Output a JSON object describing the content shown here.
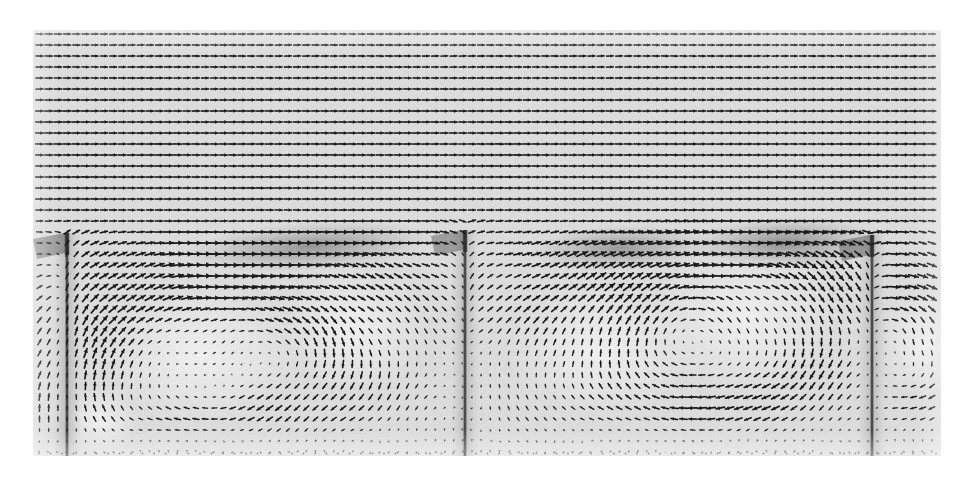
{
  "figure": {
    "kind": "vector-field-plot",
    "title": "Velocity vector field of turbulent flow over a ribbed channel wall",
    "width": 970,
    "height": 477,
    "background_color": "#ffffff",
    "field_background_color": "#dcdcdc",
    "arrow_color": "#1a1a1a",
    "shadow_color": "#6e6e6e"
  },
  "plot_area": {
    "left": 33,
    "top": 30,
    "right": 941,
    "bottom": 456,
    "width": 908,
    "height": 426
  },
  "chart_data": {
    "type": "scatter",
    "subtype": "quiver-vector-field",
    "title": "Velocity vector field of turbulent flow over a ribbed channel wall",
    "xlabel": "",
    "ylabel": "",
    "grid": false,
    "legend": null,
    "xlim": [
      0,
      908
    ],
    "ylim": [
      0,
      426
    ],
    "grid_spacing": {
      "dx": 9.2,
      "dy": 11.0
    },
    "arrow_scale": 7.6,
    "arrow_head_frac": 0.42,
    "freestream": {
      "description": "Uniform left-to-right high-speed core flow above the cavity line",
      "y_range": [
        0,
        210
      ],
      "u": 1.0,
      "v": 0.0,
      "direction_deg": 0
    },
    "cavity_line_y": 220,
    "ribs": [
      {
        "name": "rib-left",
        "x": 67,
        "top_y": 233,
        "bottom_y": 456,
        "thickness": 5
      },
      {
        "name": "rib-middle",
        "x": 465,
        "top_y": 230,
        "bottom_y": 456,
        "thickness": 5
      },
      {
        "name": "rib-right",
        "x": 872,
        "top_y": 235,
        "bottom_y": 456,
        "thickness": 5
      }
    ],
    "vortices": [
      {
        "name": "cavity-1-primary",
        "cx": 200,
        "cy": 355,
        "rx": 120,
        "ry": 82,
        "strength": 1.25,
        "sense": "counterclockwise"
      },
      {
        "name": "cavity-1-secondary",
        "cx": 355,
        "cy": 330,
        "rx": 85,
        "ry": 75,
        "strength": 0.62,
        "sense": "counterclockwise"
      },
      {
        "name": "cavity-1-corner",
        "cx": 100,
        "cy": 420,
        "rx": 45,
        "ry": 40,
        "strength": 0.35,
        "sense": "counterclockwise"
      },
      {
        "name": "cavity-2-primary",
        "cx": 745,
        "cy": 320,
        "rx": 110,
        "ry": 86,
        "strength": 1.3,
        "sense": "counterclockwise"
      },
      {
        "name": "cavity-2-upstream",
        "cx": 600,
        "cy": 350,
        "rx": 110,
        "ry": 78,
        "strength": 0.7,
        "sense": "counterclockwise"
      },
      {
        "name": "cavity-3-corner",
        "cx": 920,
        "cy": 345,
        "rx": 48,
        "ry": 62,
        "strength": 0.95,
        "sense": "counterclockwise"
      }
    ],
    "shear_layers": [
      {
        "name": "shear-band-1",
        "x0": 200,
        "x1": 420,
        "y0": 255,
        "y1": 238,
        "intensity": 0.95,
        "thickness": 16
      },
      {
        "name": "shear-band-2",
        "x0": 540,
        "x1": 700,
        "y0": 252,
        "y1": 244,
        "intensity": 0.88,
        "thickness": 15
      },
      {
        "name": "shear-band-3",
        "x0": 700,
        "x1": 870,
        "y0": 246,
        "y1": 240,
        "intensity": 1.0,
        "thickness": 17
      }
    ],
    "boundary_layer": {
      "description": "No-slip wall at bottom; arrow magnitude decays to near zero",
      "wall_y": 456,
      "decay_px": 14
    },
    "series": [
      {
        "name": "velocity vectors",
        "description": "Each glyph is a scaled arrow of the local (u,v) velocity; magnitude sets length and line weight.",
        "count_x": 99,
        "count_y": 39
      }
    ],
    "annotations": []
  }
}
